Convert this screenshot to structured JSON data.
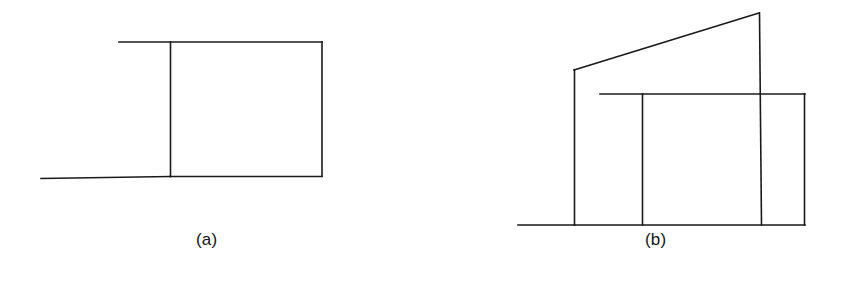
{
  "page": {
    "width": 841,
    "height": 282,
    "background_color": "#ffffff",
    "ink_color": "#1a1a1a",
    "stroke_width": 1.6,
    "type": "line-drawing"
  },
  "labels": {
    "panel_a": "(a)",
    "panel_b": "(b)"
  },
  "figures": [
    {
      "id": "figure-a",
      "label": "(a)",
      "label_position": {
        "x": 196,
        "y": 230
      },
      "strokes": [
        {
          "name": "top-horizontal-line",
          "points": "119,42 322,42"
        },
        {
          "name": "right-vertical-line",
          "points": "322,42 322,176"
        },
        {
          "name": "bottom-right-horizontal-line",
          "points": "322,176 170,176"
        },
        {
          "name": "bottom-left-horizontal-line",
          "points": "170,176 41,178"
        },
        {
          "name": "center-vertical-line",
          "points": "170,42 170,176"
        }
      ]
    },
    {
      "id": "figure-b",
      "label": "(b)",
      "label_position": {
        "x": 645,
        "y": 230
      },
      "strokes": [
        {
          "name": "slanted-roof-line",
          "points": "574,70 759,13"
        },
        {
          "name": "peak-vertical-line",
          "points": "759,13 762,225"
        },
        {
          "name": "left-post-vertical-line",
          "points": "574,70 574,225"
        },
        {
          "name": "ground-horizontal-line",
          "points": "518,225 574,225"
        },
        {
          "name": "base-horizontal-line",
          "points": "574,225 805,225"
        },
        {
          "name": "inner-top-horizontal-line",
          "points": "600,94 805,94"
        },
        {
          "name": "inner-right-vertical-line",
          "points": "805,94 805,225"
        },
        {
          "name": "inner-left-vertical-line",
          "points": "642,94 642,225"
        }
      ]
    }
  ]
}
